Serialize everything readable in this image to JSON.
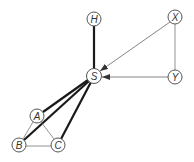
{
  "diagram": {
    "nodes": [
      {
        "id": "H",
        "label": "H",
        "x": 94,
        "y": 19
      },
      {
        "id": "X",
        "label": "X",
        "x": 175,
        "y": 17
      },
      {
        "id": "S",
        "label": "S",
        "x": 94,
        "y": 76
      },
      {
        "id": "Y",
        "label": "Y",
        "x": 175,
        "y": 77
      },
      {
        "id": "A",
        "label": "A",
        "x": 37,
        "y": 116
      },
      {
        "id": "B",
        "label": "B",
        "x": 19,
        "y": 145
      },
      {
        "id": "C",
        "label": "C",
        "x": 58,
        "y": 145
      }
    ],
    "edges": [
      {
        "from": "H",
        "to": "S",
        "style": "thick",
        "directed": false
      },
      {
        "from": "X",
        "to": "S",
        "style": "thin",
        "directed": true
      },
      {
        "from": "Y",
        "to": "S",
        "style": "thin",
        "directed": true
      },
      {
        "from": "X",
        "to": "Y",
        "style": "thin",
        "directed": false
      },
      {
        "from": "S",
        "to": "A",
        "style": "thick",
        "directed": false
      },
      {
        "from": "S",
        "to": "B",
        "style": "thick",
        "directed": false
      },
      {
        "from": "S",
        "to": "C",
        "style": "thick",
        "directed": false
      },
      {
        "from": "A",
        "to": "B",
        "style": "thin",
        "directed": false
      },
      {
        "from": "A",
        "to": "C",
        "style": "thin",
        "directed": false
      },
      {
        "from": "B",
        "to": "C",
        "style": "thin",
        "directed": false
      }
    ]
  }
}
